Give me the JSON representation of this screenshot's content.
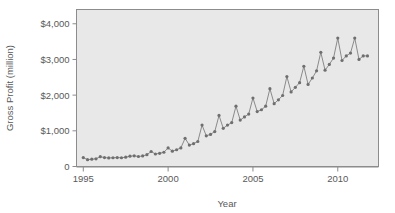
{
  "chart_data": {
    "type": "line",
    "title": "",
    "xlabel": "Year",
    "ylabel": "Gross Profit (million)",
    "xlim": [
      1994.6,
      2012.4
    ],
    "ylim": [
      0,
      4400
    ],
    "grid": false,
    "legend": null,
    "x_tick_labels": [
      "1995",
      "2000",
      "2005",
      "2010"
    ],
    "x_tick_values": [
      1995,
      2000,
      2005,
      2010
    ],
    "y_tick_labels": [
      "0",
      "$1,000",
      "$2,000",
      "$3,000",
      "$4,000"
    ],
    "y_tick_values": [
      0,
      1000,
      2000,
      3000,
      4000
    ],
    "marker": "circle",
    "line_color": "#8a8a8a",
    "marker_color": "#6f6f6f",
    "panel_color": "#e8e8e8",
    "series": [
      {
        "name": "Gross Profit",
        "x": [
          1995.0,
          1995.25,
          1995.5,
          1995.75,
          1996.0,
          1996.25,
          1996.5,
          1996.75,
          1997.0,
          1997.25,
          1997.5,
          1997.75,
          1998.0,
          1998.25,
          1998.5,
          1998.75,
          1999.0,
          1999.25,
          1999.5,
          1999.75,
          2000.0,
          2000.25,
          2000.5,
          2000.75,
          2001.0,
          2001.25,
          2001.5,
          2001.75,
          2002.0,
          2002.25,
          2002.5,
          2002.75,
          2003.0,
          2003.25,
          2003.5,
          2003.75,
          2004.0,
          2004.25,
          2004.5,
          2004.75,
          2005.0,
          2005.25,
          2005.5,
          2005.75,
          2006.0,
          2006.25,
          2006.5,
          2006.75,
          2007.0,
          2007.25,
          2007.5,
          2007.75,
          2008.0,
          2008.25,
          2008.5,
          2008.75,
          2009.0,
          2009.25,
          2009.5,
          2009.75,
          2010.0,
          2010.25,
          2010.5,
          2010.75,
          2011.0,
          2011.25,
          2011.5,
          2011.75
        ],
        "values": [
          250,
          190,
          205,
          215,
          275,
          250,
          240,
          245,
          250,
          245,
          260,
          290,
          300,
          280,
          295,
          330,
          420,
          350,
          370,
          400,
          520,
          430,
          470,
          520,
          790,
          600,
          640,
          700,
          1160,
          860,
          900,
          980,
          1430,
          1070,
          1160,
          1230,
          1690,
          1300,
          1390,
          1470,
          1920,
          1540,
          1590,
          1690,
          2180,
          1760,
          1870,
          1990,
          2520,
          2090,
          2220,
          2350,
          2810,
          2300,
          2480,
          2680,
          3200,
          2700,
          2860,
          3040,
          3600,
          2970,
          3100,
          3180,
          3600,
          3000,
          3100,
          3100
        ]
      }
    ]
  }
}
